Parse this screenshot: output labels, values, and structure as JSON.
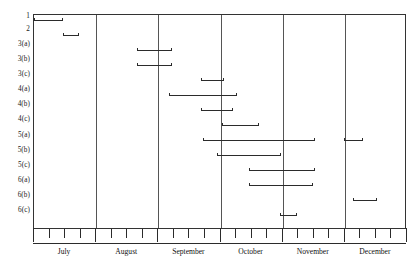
{
  "chart_data": {
    "type": "bar",
    "chart_kind": "gantt-schedule",
    "title": "",
    "xlabel": "",
    "ylabel": "",
    "grid": true,
    "legend": "none",
    "categories": [
      "1",
      "2",
      "3(a)",
      "3(b)",
      "3(c)",
      "4(a)",
      "4(b)",
      "4(c)",
      "5(a)",
      "5(b)",
      "5(c)",
      "6(a)",
      "6(b)",
      "6(c)"
    ],
    "x_axis": {
      "tick_labels": [
        "July",
        "August",
        "September",
        "October",
        "November",
        "December"
      ],
      "ticks_per_month": 4,
      "xlim": [
        0,
        24
      ],
      "unit": "weeks"
    },
    "bars": [
      {
        "task": "1",
        "row": 0,
        "segments": [
          {
            "start": 0.0,
            "end": 1.85
          }
        ]
      },
      {
        "task": "2",
        "row": 1,
        "segments": [
          {
            "start": 1.85,
            "end": 2.9
          }
        ]
      },
      {
        "task": "3(a)",
        "row": 2,
        "segments": [
          {
            "start": 6.65,
            "end": 8.85
          }
        ]
      },
      {
        "task": "3(b)",
        "row": 3,
        "segments": [
          {
            "start": 6.65,
            "end": 8.85
          }
        ]
      },
      {
        "task": "3(c)",
        "row": 4,
        "segments": [
          {
            "start": 10.75,
            "end": 12.2
          }
        ]
      },
      {
        "task": "4(a)",
        "row": 5,
        "segments": [
          {
            "start": 8.7,
            "end": 13.05
          }
        ]
      },
      {
        "task": "4(b)",
        "row": 6,
        "segments": [
          {
            "start": 10.75,
            "end": 12.8
          }
        ]
      },
      {
        "task": "4(c)",
        "row": 7,
        "segments": [
          {
            "start": 12.1,
            "end": 14.45
          }
        ]
      },
      {
        "task": "5(a)",
        "row": 8,
        "segments": [
          {
            "start": 10.9,
            "end": 18.05
          },
          {
            "start": 19.95,
            "end": 21.2
          }
        ]
      },
      {
        "task": "5(b)",
        "row": 9,
        "segments": [
          {
            "start": 11.75,
            "end": 15.9
          }
        ]
      },
      {
        "task": "5(c)",
        "row": 10,
        "segments": [
          {
            "start": 13.85,
            "end": 18.05
          }
        ]
      },
      {
        "task": "6(a)",
        "row": 11,
        "segments": [
          {
            "start": 13.85,
            "end": 17.95
          }
        ]
      },
      {
        "task": "6(b)",
        "row": 12,
        "segments": [
          {
            "start": 20.55,
            "end": 22.05
          }
        ]
      },
      {
        "task": "6(c)",
        "row": 13,
        "segments": [
          {
            "start": 15.85,
            "end": 16.9
          }
        ]
      }
    ]
  },
  "axis": {
    "task_labels": [
      {
        "label": "1",
        "y": 16
      },
      {
        "label": "2",
        "y": 29
      },
      {
        "label": "3(a)",
        "y": 44
      },
      {
        "label": "3(b)",
        "y": 59
      },
      {
        "label": "3(c)",
        "y": 74
      },
      {
        "label": "4(a)",
        "y": 89
      },
      {
        "label": "4(b)",
        "y": 104
      },
      {
        "label": "4(c)",
        "y": 119
      },
      {
        "label": "5(a)",
        "y": 135
      },
      {
        "label": "5(b)",
        "y": 150
      },
      {
        "label": "5(c)",
        "y": 165
      },
      {
        "label": "6(a)",
        "y": 180
      },
      {
        "label": "6(b)",
        "y": 195
      },
      {
        "label": "6(c)",
        "y": 210
      }
    ],
    "months": [
      "July",
      "August",
      "September",
      "December",
      "October",
      "November"
    ],
    "month_labels": [
      {
        "label": "July",
        "center": 2
      },
      {
        "label": "August",
        "center": 6
      },
      {
        "label": "September",
        "center": 10
      },
      {
        "label": "October",
        "center": 14
      },
      {
        "label": "November",
        "center": 18
      },
      {
        "label": "December",
        "center": 22
      }
    ]
  },
  "style": {
    "bar_color": "#2b2b2b",
    "frame_color": "#333333",
    "divider_color": "#555555",
    "background": "#ffffff"
  }
}
